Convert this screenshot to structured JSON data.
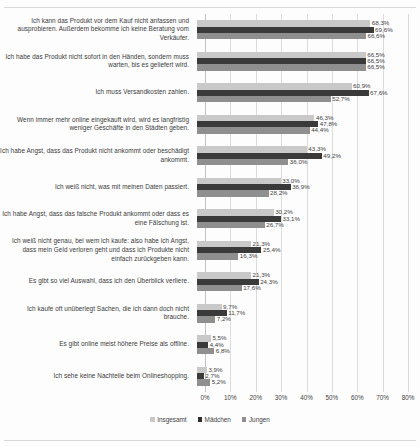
{
  "chart_data": {
    "type": "bar",
    "orientation": "horizontal",
    "title": "",
    "subtitle": "",
    "xlabel": "",
    "ylabel": "",
    "xlim": [
      0,
      80
    ],
    "grid": true,
    "legend_position": "bottom",
    "tick_labels": [
      "0%",
      "10%",
      "20%",
      "30%",
      "40%",
      "50%",
      "60%",
      "70%",
      "80%"
    ],
    "tick_values": [
      0,
      10,
      20,
      30,
      40,
      50,
      60,
      70,
      80
    ],
    "categories": [
      "Ich kann das Produkt vor dem Kauf nicht anfassen und ausprobieren. Außerdem bekomme ich keine Beratung vom Verkäufer.",
      "Ich habe das Produkt nicht sofort in den Händen, sondern muss warten, bis es geliefert wird.",
      "Ich muss Versandkosten zahlen.",
      "Wenn immer mehr online eingekauft wird, wird es langfristig weniger Geschäfte in den Städten geben.",
      "Ich habe Angst, dass das Produkt nicht ankommt oder beschädigt ankommt.",
      "Ich weiß nicht, was mit meinen Daten passiert.",
      "Ich habe Angst, dass das falsche Produkt ankommt oder dass es eine Fälschung ist.",
      "Ich weiß nicht genau, bei wem ich kaufe: also habe ich Angst, dass mein Geld verloren geht und dass ich Produkte nicht einfach zurückgeben kann.",
      "Es gibt so viel Auswahl, dass ich den Überblick verliere.",
      "Ich kaufe oft unüberlegt Sachen, die ich dann doch nicht brauche.",
      "Es gibt online meist höhere Preise als offline.",
      "Ich sehe keine Nachteile beim Onlineshopping."
    ],
    "series": [
      {
        "name": "Insgesamt",
        "color": "#c9c9c9",
        "values": [
          68.3,
          66.5,
          60.9,
          46.3,
          43.3,
          33.0,
          30.2,
          21.3,
          21.3,
          9.7,
          5.5,
          3.9
        ],
        "labels": [
          "68,3%",
          "66,5%",
          "60,9%",
          "46,3%",
          "43,3%",
          "33,0%",
          "30,2%",
          "21,3%",
          "21,3%",
          "9,7%",
          "5,5%",
          "3,9%"
        ]
      },
      {
        "name": "Mädchen",
        "color": "#3a3a3a",
        "values": [
          69.6,
          66.5,
          67.6,
          47.8,
          49.2,
          36.9,
          33.1,
          25.4,
          24.3,
          11.7,
          4.4,
          2.7
        ],
        "labels": [
          "69,6%",
          "66,5%",
          "67,6%",
          "47,8%",
          "49,2%",
          "36,9%",
          "33,1%",
          "25,4%",
          "24,3%",
          "11,7%",
          "4,4%",
          "2,7%"
        ]
      },
      {
        "name": "Jungen",
        "color": "#8f8f8f",
        "values": [
          66.6,
          66.5,
          52.7,
          44.4,
          36.0,
          28.2,
          26.7,
          16.3,
          17.6,
          7.2,
          6.8,
          5.2
        ],
        "labels": [
          "66,6%",
          "66,5%",
          "52,7%",
          "44,4%",
          "36,0%",
          "28,2%",
          "26,7%",
          "16,3%",
          "17,6%",
          "7,2%",
          "6,8%",
          "5,2%"
        ]
      }
    ]
  },
  "legend": {
    "items": [
      {
        "label": "Insgesamt",
        "color": "#c9c9c9"
      },
      {
        "label": "Mädchen",
        "color": "#2e2e2e"
      },
      {
        "label": "Jungen",
        "color": "#8f8f8f"
      }
    ]
  }
}
